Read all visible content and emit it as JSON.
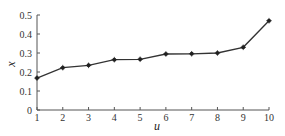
{
  "chart_data": {
    "type": "line",
    "title": "",
    "xlabel": "u",
    "ylabel": "x",
    "x": [
      1,
      2,
      3,
      4,
      5,
      6,
      7,
      8,
      9,
      10
    ],
    "series": [
      {
        "name": "x",
        "values": [
          0.168,
          0.223,
          0.235,
          0.265,
          0.267,
          0.295,
          0.296,
          0.3,
          0.33,
          0.47
        ]
      }
    ],
    "xlim": [
      1,
      10
    ],
    "ylim": [
      0,
      0.5
    ],
    "xticks": [
      "1",
      "2",
      "3",
      "4",
      "5",
      "6",
      "7",
      "8",
      "9",
      "10"
    ],
    "yticks": [
      "0",
      "0.1",
      "0.2",
      "0.3",
      "0.4",
      "0.5"
    ],
    "grid": false,
    "legend": null,
    "line_color": "#333333",
    "marker": "star"
  }
}
